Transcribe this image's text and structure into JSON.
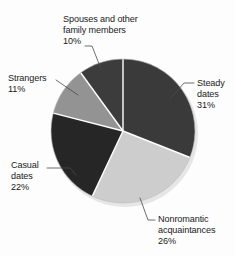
{
  "chart_data": {
    "type": "pie",
    "title": "",
    "subtitle": "",
    "xlabel": "",
    "ylabel": "",
    "legend_position": "none",
    "grid": false,
    "label_format": "name + percent",
    "start_angle_deg": 0,
    "direction": "clockwise",
    "categories": [
      "Steady dates",
      "Nonromantic acquaintances",
      "Casual dates",
      "Strangers",
      "Spouses and other family members"
    ],
    "values": [
      31,
      26,
      22,
      11,
      10
    ],
    "units": "percent",
    "total": 100,
    "colors": [
      "#3a3a3a",
      "#cdcdcd",
      "#262626",
      "#939393",
      "#3c3c3c"
    ],
    "slices": [
      {
        "name": "Steady dates",
        "value": 31,
        "percent_text": "31%",
        "color": "#3a3a3a",
        "label_lines": [
          "Steady",
          "dates",
          "31%"
        ]
      },
      {
        "name": "Nonromantic acquaintances",
        "value": 26,
        "percent_text": "26%",
        "color": "#cdcdcd",
        "label_lines": [
          "Nonromantic",
          "acquaintances",
          "26%"
        ]
      },
      {
        "name": "Casual dates",
        "value": 22,
        "percent_text": "22%",
        "color": "#262626",
        "label_lines": [
          "Casual",
          "dates",
          "22%"
        ]
      },
      {
        "name": "Strangers",
        "value": 11,
        "percent_text": "11%",
        "color": "#939393",
        "label_lines": [
          "Strangers",
          "11%"
        ]
      },
      {
        "name": "Spouses and other family members",
        "value": 10,
        "percent_text": "10%",
        "color": "#3c3c3c",
        "label_lines": [
          "Spouses and other",
          "family members",
          "10%"
        ]
      }
    ]
  },
  "labels": {
    "spouses": {
      "line1": "Spouses and other",
      "line2": "family members",
      "line3": "10%"
    },
    "strangers": {
      "line1": "Strangers",
      "line2": "11%"
    },
    "casual": {
      "line1": "Casual",
      "line2": "dates",
      "line3": "22%"
    },
    "steady": {
      "line1": "Steady",
      "line2": "dates",
      "line3": "31%"
    },
    "nonromantic": {
      "line1": "Nonromantic",
      "line2": "acquaintances",
      "line3": "26%"
    }
  },
  "style": {
    "background": "#fdfdfd",
    "text_color": "#1a1a1a",
    "separator_color": "#ffffff",
    "leader_line_color": "#4a4a4a",
    "pie_center_x": 123,
    "pie_center_y": 131,
    "pie_radius": 72
  }
}
